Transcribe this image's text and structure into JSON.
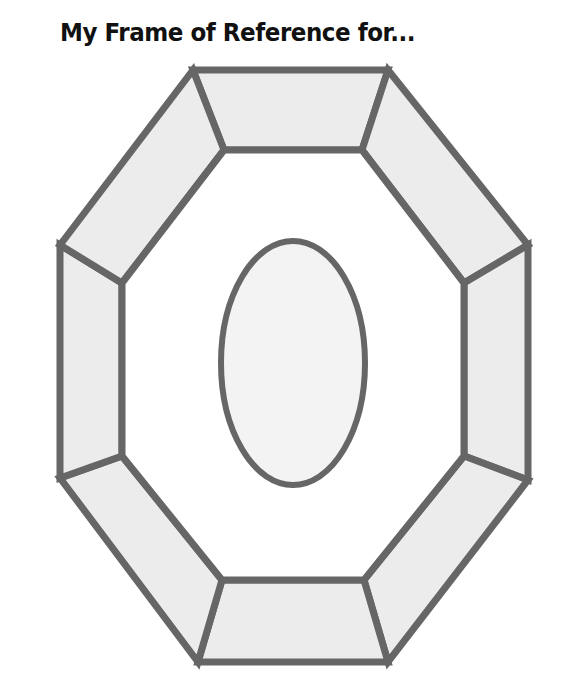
{
  "title": "My Frame of Reference for...",
  "diagram": {
    "type": "octagonal frame with central oval",
    "colors": {
      "stroke": "#666666",
      "fill": "#eeeeee",
      "inner_fill": "#ffffff",
      "oval_fill": "#f3f3f3"
    },
    "outer_octagon": [
      [
        193,
        70
      ],
      [
        388,
        70
      ],
      [
        528,
        245
      ],
      [
        528,
        480
      ],
      [
        388,
        662
      ],
      [
        198,
        662
      ],
      [
        60,
        478
      ],
      [
        60,
        245
      ]
    ],
    "inner_octagon": [
      [
        224,
        150
      ],
      [
        362,
        150
      ],
      [
        464,
        283
      ],
      [
        464,
        456
      ],
      [
        364,
        580
      ],
      [
        222,
        580
      ],
      [
        122,
        456
      ],
      [
        122,
        283
      ]
    ],
    "segments": 8,
    "oval": {
      "cx": 293,
      "cy": 363,
      "rx": 72,
      "ry": 122
    }
  }
}
